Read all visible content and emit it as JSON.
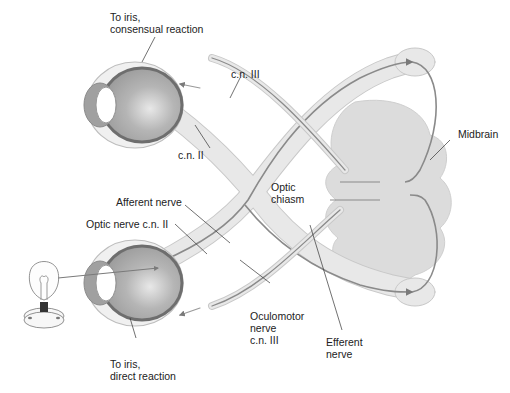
{
  "diagram": {
    "labels": {
      "to_iris_consensual_line1": "To iris,",
      "to_iris_consensual_line2": "consensual reaction",
      "cn_iii_top": "c.n. III",
      "cn_ii_top": "c.n. II",
      "midbrain": "Midbrain",
      "afferent_nerve": "Afferent nerve",
      "optic_nerve_cn_ii": "Optic nerve c.n. II",
      "optic_chiasm_line1": "Optic",
      "optic_chiasm_line2": "chiasm",
      "oculomotor_line1": "Oculomotor",
      "oculomotor_line2": "nerve",
      "oculomotor_line3": "c.n. III",
      "efferent_line1": "Efferent",
      "efferent_line2": "nerve",
      "to_iris_direct_line1": "To iris,",
      "to_iris_direct_line2": "direct reaction"
    },
    "colors": {
      "tissue_fill": "#e6e6e6",
      "tissue_stroke": "#c4c4c4",
      "midbrain_fill": "#dcdcdc",
      "nerve_line": "#8a8a8a",
      "eye_inner": "#a9a9a9",
      "eye_retina": "#6e6e6e",
      "text": "#222222"
    }
  }
}
